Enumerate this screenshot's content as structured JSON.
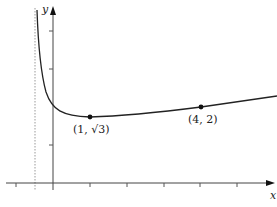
{
  "figure": {
    "axes": {
      "x_label": "x",
      "y_label": "y"
    },
    "points": [
      {
        "label": "(1, √3)",
        "x": 1,
        "y": 1.732
      },
      {
        "label": "(4, 2)",
        "x": 4,
        "y": 2
      }
    ],
    "asymptote": {
      "type": "vertical",
      "x": -0.5,
      "style": "dotted"
    },
    "colors": {
      "curve": "#222222",
      "axis": "#444444",
      "asymptote": "#888888"
    }
  }
}
